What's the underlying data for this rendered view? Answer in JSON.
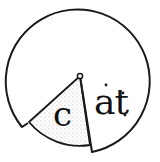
{
  "illustration": {
    "description": "word-family spinner wheel",
    "wedge_letter": "c",
    "wheel_letters": "at",
    "colors": {
      "stroke": "#1a1a1a",
      "background": "#ffffff",
      "stipple": "#9a9a9a"
    }
  }
}
